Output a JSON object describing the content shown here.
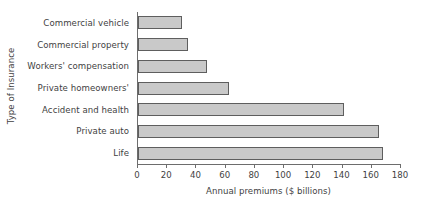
{
  "chart_data": {
    "type": "bar",
    "orientation": "horizontal",
    "title": "",
    "xlabel": "Annual premiums ($ billions)",
    "ylabel": "Type of Insurance",
    "categories": [
      "Commercial vehicle",
      "Commercial property",
      "Workers' compensation",
      "Private homeowners'",
      "Accident and health",
      "Private auto",
      "Life"
    ],
    "values": [
      30,
      34,
      47,
      62,
      141,
      165,
      168
    ],
    "xlim": [
      0,
      180
    ],
    "xticks": [
      0,
      20,
      40,
      60,
      80,
      100,
      120,
      140,
      160,
      180
    ],
    "xtick_labels": [
      "0",
      "20",
      "40",
      "60",
      "80",
      "100",
      "120",
      "140",
      "160",
      "180"
    ],
    "grid": false,
    "legend": false,
    "bar_fill_color": "#c9c9c9",
    "bar_border_color": "#5e5e5e",
    "axis_color": "#6d6d6d",
    "text_color": "#3f3f3f"
  }
}
